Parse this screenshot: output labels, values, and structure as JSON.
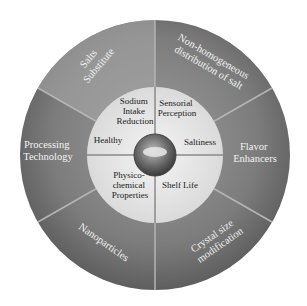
{
  "diagram": {
    "center_icon": "salt-pile-icon",
    "outer_ring": [
      {
        "label_lines": [
          "Salts",
          "Substitute"
        ]
      },
      {
        "label_lines": [
          "Non-homogeneous",
          "distribution of salt"
        ]
      },
      {
        "label_lines": [
          "Flavor",
          "Enhancers"
        ]
      },
      {
        "label_lines": [
          "Crystal size",
          "modification"
        ]
      },
      {
        "label_lines": [
          "Nanoparticles"
        ]
      },
      {
        "label_lines": [
          "Processing",
          "Technology"
        ]
      }
    ],
    "inner_ring": [
      {
        "label_lines": [
          "Sodium",
          "Intake",
          "Reduction"
        ]
      },
      {
        "label_lines": [
          "Sensorial",
          "Perception"
        ]
      },
      {
        "label_lines": [
          "Saltiness"
        ]
      },
      {
        "label_lines": [
          "Shelf Life"
        ]
      },
      {
        "label_lines": [
          "Physico-",
          "chemical",
          "Properties"
        ]
      },
      {
        "label_lines": [
          "Healthy"
        ]
      }
    ],
    "colors": {
      "outer_ring": "#7a7a7a",
      "outer_ring_light": "#9a9a9a",
      "inner_ring": "#e4e4e4",
      "hub": "#5a5a5a",
      "divider": "#bdbdbd"
    }
  }
}
